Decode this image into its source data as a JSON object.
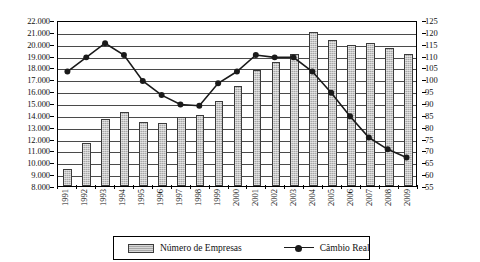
{
  "chart_data": {
    "type": "bar",
    "title": "",
    "subtitle": "",
    "xlabel": "",
    "ylabel": "",
    "grid": true,
    "legend_position": "bottom",
    "categories": [
      "1991",
      "1992",
      "1993",
      "1994",
      "1995",
      "1996",
      "1997",
      "1998",
      "1999",
      "2000",
      "2001",
      "2002",
      "2003",
      "2004",
      "2005",
      "2006",
      "2007",
      "2008",
      "2009"
    ],
    "series": [
      {
        "name": "Número de Empresas",
        "type": "bar",
        "axis": "left",
        "values": [
          9450,
          11600,
          13650,
          14250,
          13400,
          13300,
          13800,
          13950,
          15150,
          16400,
          17800,
          18450,
          19100,
          21000,
          20350,
          19900,
          20100,
          19650,
          19150
        ]
      },
      {
        "name": "Câmbio Real",
        "type": "line",
        "axis": "right",
        "values": [
          104,
          110,
          116,
          111,
          100,
          94,
          90,
          89.5,
          99,
          104,
          111,
          110,
          110,
          104,
          95,
          85,
          76,
          71,
          67.5
        ]
      }
    ],
    "y_left": {
      "min": 8000,
      "max": 22000,
      "step": 1000,
      "ticks": [
        "8.000",
        "9.000",
        "10.000",
        "11.000",
        "12.000",
        "13.000",
        "14.000",
        "15.000",
        "16.000",
        "17.000",
        "18.000",
        "19.000",
        "20.000",
        "21.000",
        "22.000"
      ]
    },
    "y_right": {
      "min": 55,
      "max": 125,
      "step": 5,
      "ticks": [
        "55",
        "60",
        "65",
        "70",
        "75",
        "80",
        "85",
        "90",
        "95",
        "100",
        "105",
        "110",
        "115",
        "120",
        "125"
      ]
    },
    "colors": {
      "bar_fill": "#a8a8a8",
      "bar_stroke": "#3b3b3b",
      "line": "#1a1a1a",
      "grid": "#4a4a4a",
      "axis": "#000000",
      "background": "#ffffff"
    }
  },
  "legend": {
    "items": [
      {
        "label": "Número de Empresas",
        "marker": "bar-swatch"
      },
      {
        "label": "Câmbio Real",
        "marker": "line-with-dot"
      }
    ]
  }
}
